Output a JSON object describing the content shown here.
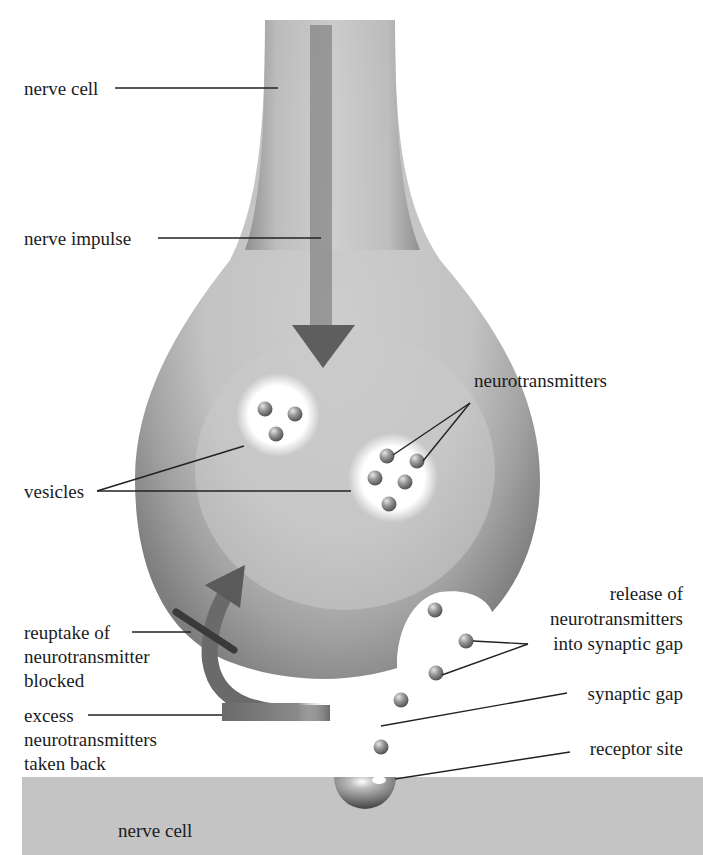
{
  "diagram": {
    "labels": {
      "nerve_cell_top": "nerve cell",
      "nerve_impulse": "nerve impulse",
      "neurotransmitters": "neurotransmitters",
      "vesicles": "vesicles",
      "release_line1": "release of",
      "release_line2": "neurotransmitters",
      "release_line3": "into synaptic gap",
      "reuptake_line1": "reuptake of",
      "reuptake_line2": "neurotransmitter",
      "reuptake_line3": "blocked",
      "synaptic_gap": "synaptic gap",
      "excess_line1": "excess",
      "excess_line2": "neurotransmitters",
      "excess_line3": "taken back",
      "receptor_site": "receptor site",
      "nerve_cell_bottom": "nerve cell"
    },
    "colors": {
      "cell_dark": "#7a7a7a",
      "cell_mid": "#a9a9a9",
      "cell_light": "#c8c8c8",
      "arrow": "#5a5a5a",
      "block_bar": "#3a3a3a",
      "bottom_cell": "#c4c4c4",
      "leader_line": "#222222"
    }
  }
}
